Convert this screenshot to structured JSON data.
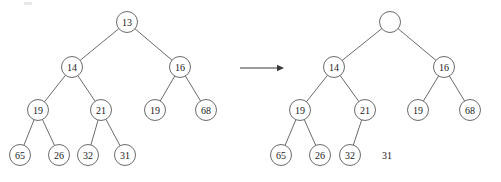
{
  "figure": {
    "node_radius": 10.5,
    "stroke_color": "#5a5a5a",
    "text_color": "#1a1a1a",
    "arrow_color": "#3a3a3a",
    "background": "#ffffff"
  },
  "arrow": {
    "name": "transformation-arrow",
    "x1": 240,
    "y1": 68,
    "x2": 284,
    "y2": 68
  },
  "left_tree": {
    "name": "tree-before",
    "nodes": [
      {
        "id": "L0",
        "label": "13",
        "cx": 127,
        "cy": 22,
        "empty": false,
        "detached": false
      },
      {
        "id": "L1",
        "label": "14",
        "cx": 72,
        "cy": 67,
        "empty": false,
        "detached": false
      },
      {
        "id": "L2",
        "label": "16",
        "cx": 180,
        "cy": 67,
        "empty": false,
        "detached": false
      },
      {
        "id": "L3",
        "label": "19",
        "cx": 38,
        "cy": 110,
        "empty": false,
        "detached": false
      },
      {
        "id": "L4",
        "label": "21",
        "cx": 101,
        "cy": 110,
        "empty": false,
        "detached": false
      },
      {
        "id": "L5",
        "label": "19",
        "cx": 155,
        "cy": 110,
        "empty": false,
        "detached": false
      },
      {
        "id": "L6",
        "label": "68",
        "cx": 206,
        "cy": 110,
        "empty": false,
        "detached": false
      },
      {
        "id": "L7",
        "label": "65",
        "cx": 20,
        "cy": 155,
        "empty": false,
        "detached": false
      },
      {
        "id": "L8",
        "label": "26",
        "cx": 59,
        "cy": 155,
        "empty": false,
        "detached": false
      },
      {
        "id": "L9",
        "label": "32",
        "cx": 88,
        "cy": 155,
        "empty": false,
        "detached": false
      },
      {
        "id": "L10",
        "label": "31",
        "cx": 125,
        "cy": 155,
        "empty": false,
        "detached": false
      }
    ],
    "edges": [
      {
        "from": "L0",
        "to": "L1"
      },
      {
        "from": "L0",
        "to": "L2"
      },
      {
        "from": "L1",
        "to": "L3"
      },
      {
        "from": "L1",
        "to": "L4"
      },
      {
        "from": "L2",
        "to": "L5"
      },
      {
        "from": "L2",
        "to": "L6"
      },
      {
        "from": "L3",
        "to": "L7"
      },
      {
        "from": "L3",
        "to": "L8"
      },
      {
        "from": "L4",
        "to": "L9"
      },
      {
        "from": "L4",
        "to": "L10"
      }
    ]
  },
  "right_tree": {
    "name": "tree-after",
    "nodes": [
      {
        "id": "R0",
        "label": "",
        "cx": 390,
        "cy": 22,
        "empty": true,
        "detached": false
      },
      {
        "id": "R1",
        "label": "14",
        "cx": 334,
        "cy": 67,
        "empty": false,
        "detached": false
      },
      {
        "id": "R2",
        "label": "16",
        "cx": 444,
        "cy": 67,
        "empty": false,
        "detached": false
      },
      {
        "id": "R3",
        "label": "19",
        "cx": 300,
        "cy": 110,
        "empty": false,
        "detached": false
      },
      {
        "id": "R4",
        "label": "21",
        "cx": 365,
        "cy": 110,
        "empty": false,
        "detached": false
      },
      {
        "id": "R5",
        "label": "19",
        "cx": 418,
        "cy": 110,
        "empty": false,
        "detached": false
      },
      {
        "id": "R6",
        "label": "68",
        "cx": 470,
        "cy": 110,
        "empty": false,
        "detached": false
      },
      {
        "id": "R7",
        "label": "65",
        "cx": 281,
        "cy": 155,
        "empty": false,
        "detached": false
      },
      {
        "id": "R8",
        "label": "26",
        "cx": 320,
        "cy": 155,
        "empty": false,
        "detached": false
      },
      {
        "id": "R9",
        "label": "32",
        "cx": 350,
        "cy": 155,
        "empty": false,
        "detached": false
      },
      {
        "id": "R10",
        "label": "31",
        "cx": 387,
        "cy": 155,
        "empty": false,
        "detached": true
      }
    ],
    "edges": [
      {
        "from": "R0",
        "to": "R1"
      },
      {
        "from": "R0",
        "to": "R2"
      },
      {
        "from": "R1",
        "to": "R3"
      },
      {
        "from": "R1",
        "to": "R4"
      },
      {
        "from": "R2",
        "to": "R5"
      },
      {
        "from": "R2",
        "to": "R6"
      },
      {
        "from": "R3",
        "to": "R7"
      },
      {
        "from": "R3",
        "to": "R8"
      },
      {
        "from": "R4",
        "to": "R9"
      }
    ]
  }
}
